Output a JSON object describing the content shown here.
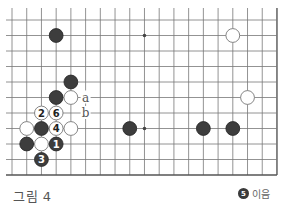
{
  "figure": {
    "caption": "그림 4",
    "legend": {
      "stone_color": "black",
      "move_number": "5",
      "text": "이음"
    }
  },
  "board": {
    "columns": 19,
    "rows": 11,
    "origin_x": 12,
    "origin_y": 20,
    "spacing_x": 14.72,
    "spacing_y": 15.5,
    "line_color": "#777777",
    "edge_color": "#555555",
    "black_color": "#3d3d3d",
    "white_fill": "#ffffff",
    "white_stroke": "#777777",
    "closed_edges": [
      "right",
      "bottom"
    ],
    "hoshi": [
      {
        "c": 9,
        "r": 1
      },
      {
        "c": 9,
        "r": 7
      }
    ],
    "stones": [
      {
        "c": 3,
        "r": 1,
        "color": "black",
        "label": ""
      },
      {
        "c": 15,
        "r": 1,
        "color": "white",
        "label": ""
      },
      {
        "c": 4,
        "r": 4,
        "color": "black",
        "label": ""
      },
      {
        "c": 3,
        "r": 5,
        "color": "black",
        "label": ""
      },
      {
        "c": 4,
        "r": 5,
        "color": "white",
        "label": ""
      },
      {
        "c": 16,
        "r": 5,
        "color": "white",
        "label": ""
      },
      {
        "c": 2,
        "r": 6,
        "color": "white",
        "label": "2"
      },
      {
        "c": 3,
        "r": 6,
        "color": "white",
        "label": "6"
      },
      {
        "c": 1,
        "r": 7,
        "color": "white",
        "label": ""
      },
      {
        "c": 2,
        "r": 7,
        "color": "black",
        "label": ""
      },
      {
        "c": 3,
        "r": 7,
        "color": "white",
        "label": "4"
      },
      {
        "c": 4,
        "r": 7,
        "color": "white",
        "label": ""
      },
      {
        "c": 8,
        "r": 7,
        "color": "black",
        "label": ""
      },
      {
        "c": 13,
        "r": 7,
        "color": "black",
        "label": ""
      },
      {
        "c": 15,
        "r": 7,
        "color": "black",
        "label": ""
      },
      {
        "c": 1,
        "r": 8,
        "color": "black",
        "label": ""
      },
      {
        "c": 2,
        "r": 8,
        "color": "white",
        "label": ""
      },
      {
        "c": 3,
        "r": 8,
        "color": "black",
        "label": "1"
      },
      {
        "c": 2,
        "r": 9,
        "color": "black",
        "label": "3"
      }
    ],
    "markers": [
      {
        "c": 5,
        "r": 5,
        "text": "a"
      },
      {
        "c": 5,
        "r": 6,
        "text": "b"
      }
    ]
  }
}
